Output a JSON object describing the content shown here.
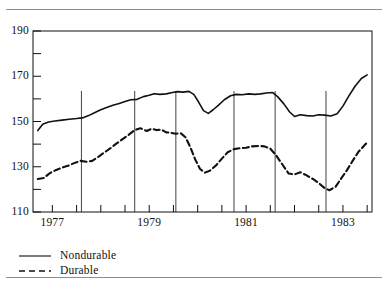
{
  "figure": {
    "background": "#ffffff",
    "ink": "#1a1a1a",
    "rule_color": "#8d8d8d"
  },
  "chart_data": {
    "type": "line",
    "title": "",
    "subtitle": "",
    "xlabel": "",
    "ylabel": "",
    "xlim": [
      1976.6,
      1983.6
    ],
    "ylim": [
      110,
      190
    ],
    "grid": false,
    "legend_position": "below-left",
    "y_ticks_major": [
      110,
      130,
      150,
      170,
      190
    ],
    "y_ticks_minor": [
      120,
      140,
      160,
      180
    ],
    "y_tick_labels": [
      "110",
      "130",
      "150",
      "170",
      "190"
    ],
    "x_ticks": [
      1977.0,
      1977.5,
      1978.0,
      1978.5,
      1979.0,
      1979.5,
      1980.0,
      1980.5,
      1981.0,
      1981.5,
      1982.0,
      1982.5,
      1983.0,
      1983.5
    ],
    "x_tick_labels_shown": [
      "1977",
      "1979",
      "1981",
      "1983"
    ],
    "x_label_positions": [
      1977.0,
      1979.0,
      1981.0,
      1983.0
    ],
    "recession_markers": [
      1977.6,
      1978.7,
      1979.55,
      1980.75,
      1981.6,
      1982.65
    ],
    "series": [
      {
        "name": "Nondurable",
        "style": "solid",
        "color": "#111111",
        "x": [
          1976.7,
          1976.8,
          1976.92,
          1977.05,
          1977.2,
          1977.35,
          1977.5,
          1977.62,
          1977.75,
          1977.88,
          1978.0,
          1978.12,
          1978.25,
          1978.38,
          1978.5,
          1978.62,
          1978.75,
          1978.88,
          1979.0,
          1979.1,
          1979.22,
          1979.35,
          1979.48,
          1979.58,
          1979.7,
          1979.82,
          1979.92,
          1980.02,
          1980.12,
          1980.22,
          1980.32,
          1980.42,
          1980.55,
          1980.68,
          1980.8,
          1980.92,
          1981.05,
          1981.18,
          1981.3,
          1981.42,
          1981.55,
          1981.65,
          1981.78,
          1981.9,
          1982.0,
          1982.12,
          1982.25,
          1982.38,
          1982.5,
          1982.62,
          1982.75,
          1982.88,
          1983.0,
          1983.12,
          1983.25,
          1983.38,
          1983.5
        ],
        "y": [
          146.0,
          148.8,
          149.8,
          150.2,
          150.6,
          151.0,
          151.3,
          151.6,
          152.6,
          154.0,
          155.2,
          156.2,
          157.2,
          158.0,
          158.8,
          159.6,
          159.8,
          161.0,
          161.6,
          162.3,
          162.0,
          162.2,
          162.8,
          163.2,
          163.0,
          163.3,
          162.0,
          158.6,
          154.8,
          153.6,
          155.2,
          157.0,
          159.6,
          161.4,
          162.0,
          161.8,
          162.2,
          162.0,
          162.2,
          162.6,
          162.8,
          161.0,
          157.8,
          154.2,
          152.2,
          153.0,
          152.6,
          152.4,
          153.0,
          152.8,
          152.4,
          153.4,
          156.8,
          161.2,
          165.6,
          169.0,
          170.6
        ]
      },
      {
        "name": "Durable",
        "style": "dashed",
        "color": "#111111",
        "x": [
          1976.7,
          1976.82,
          1976.95,
          1977.08,
          1977.2,
          1977.32,
          1977.45,
          1977.58,
          1977.7,
          1977.82,
          1977.95,
          1978.08,
          1978.2,
          1978.32,
          1978.45,
          1978.58,
          1978.7,
          1978.82,
          1978.95,
          1979.05,
          1979.15,
          1979.25,
          1979.35,
          1979.45,
          1979.55,
          1979.65,
          1979.75,
          1979.85,
          1979.95,
          1980.05,
          1980.15,
          1980.25,
          1980.38,
          1980.5,
          1980.62,
          1980.75,
          1980.88,
          1981.0,
          1981.12,
          1981.25,
          1981.38,
          1981.5,
          1981.62,
          1981.75,
          1981.88,
          1982.0,
          1982.12,
          1982.25,
          1982.38,
          1982.5,
          1982.62,
          1982.72,
          1982.85,
          1982.95,
          1983.08,
          1983.2,
          1983.32,
          1983.45,
          1983.5
        ],
        "y": [
          124.6,
          125.0,
          127.2,
          128.6,
          129.6,
          130.4,
          131.6,
          132.6,
          132.2,
          132.6,
          134.4,
          136.4,
          138.2,
          140.2,
          142.2,
          144.2,
          146.2,
          147.0,
          145.8,
          146.8,
          146.2,
          146.4,
          145.2,
          145.0,
          144.6,
          144.8,
          143.0,
          138.6,
          133.2,
          129.0,
          127.4,
          128.2,
          130.6,
          133.6,
          136.4,
          137.8,
          138.2,
          138.4,
          139.0,
          139.2,
          139.0,
          138.0,
          135.0,
          131.0,
          127.0,
          126.6,
          127.6,
          126.2,
          124.6,
          122.8,
          120.6,
          119.6,
          121.2,
          124.4,
          128.4,
          132.6,
          136.6,
          139.6,
          140.8
        ]
      }
    ]
  },
  "legend": {
    "items": [
      {
        "label": "Nondurable",
        "style": "solid"
      },
      {
        "label": "Durable",
        "style": "dashed"
      }
    ]
  }
}
